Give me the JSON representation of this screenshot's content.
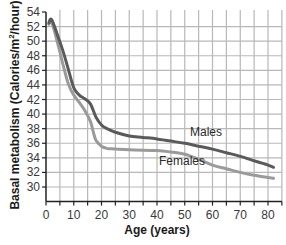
{
  "chart_data": {
    "type": "line",
    "title": "",
    "xlabel": "Age (years)",
    "ylabel": "Basal metabolism (Calories/m²/hour)",
    "xlim": [
      0,
      85
    ],
    "ylim": [
      28,
      54
    ],
    "x_ticks": [
      0,
      10,
      20,
      30,
      40,
      50,
      60,
      70,
      80
    ],
    "y_ticks": [
      30,
      32,
      34,
      36,
      38,
      40,
      42,
      44,
      46,
      48,
      50,
      52,
      54
    ],
    "grid": true,
    "grid_x_step": 5,
    "grid_y_step": 2,
    "legend": "inline labels",
    "series": [
      {
        "name": "Males",
        "color": "#5a5a5a",
        "x": [
          1,
          2,
          4,
          6,
          8,
          10,
          12,
          14,
          16,
          18,
          20,
          22,
          25,
          30,
          35,
          40,
          45,
          50,
          55,
          60,
          65,
          70,
          75,
          80,
          82
        ],
        "values": [
          52.5,
          53,
          51,
          48.8,
          46.2,
          43.6,
          42.6,
          42.1,
          41.4,
          39.6,
          38.5,
          38,
          37.5,
          37.0,
          36.8,
          36.6,
          36.3,
          36.0,
          35.6,
          35.2,
          34.7,
          34.2,
          33.6,
          33.0,
          32.7
        ]
      },
      {
        "name": "Females",
        "color": "#9a9a9a",
        "x": [
          1,
          2,
          4,
          6,
          8,
          10,
          12,
          14,
          16,
          17,
          18,
          20,
          22,
          25,
          30,
          40,
          45,
          50,
          55,
          60,
          65,
          70,
          75,
          80,
          82
        ],
        "values": [
          52.3,
          52.7,
          50,
          47,
          44.2,
          42.6,
          41.6,
          40.5,
          39,
          37.6,
          36.4,
          35.6,
          35.3,
          35.2,
          35.1,
          35.0,
          34.8,
          34.5,
          33.8,
          33.0,
          32.5,
          32.0,
          31.6,
          31.3,
          31.2
        ]
      }
    ],
    "annotations": [
      {
        "text": "Males",
        "x": 52,
        "y": 37
      },
      {
        "text": "Females",
        "x": 48,
        "y": 33.4
      }
    ]
  },
  "labels": {
    "xlabel": "Age (years)",
    "ylabel_main": "Basal metabolism (Calories/m",
    "ylabel_sup": "2",
    "ylabel_end": "/hour)",
    "males": "Males",
    "females": "Females",
    "x_ticks": [
      "0",
      "10",
      "20",
      "30",
      "40",
      "50",
      "60",
      "70",
      "80"
    ],
    "y_ticks": [
      "30",
      "32",
      "34",
      "36",
      "38",
      "40",
      "42",
      "44",
      "46",
      "48",
      "50",
      "52",
      "54"
    ]
  }
}
